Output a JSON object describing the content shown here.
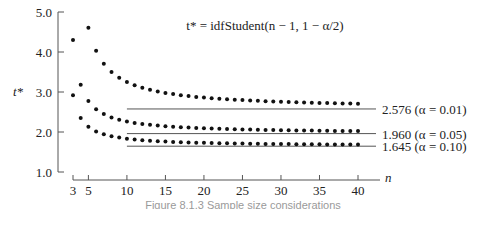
{
  "chart_data": {
    "type": "scatter",
    "title": "",
    "formula": "t* = idfStudent(n − 1, 1 − α/2)",
    "xlabel": "n",
    "ylabel": "t*",
    "xlim": [
      3,
      40
    ],
    "ylim": [
      1.0,
      5.0
    ],
    "x_ticks": [
      3,
      5,
      10,
      15,
      20,
      25,
      30,
      35,
      40
    ],
    "y_ticks": [
      "1.0",
      "2.0",
      "3.0",
      "4.0",
      "5.0"
    ],
    "grid": false,
    "series": [
      {
        "name": "α = 0.01",
        "x": [
          3,
          4,
          5,
          6,
          7,
          8,
          9,
          10,
          11,
          12,
          13,
          14,
          15,
          16,
          17,
          18,
          19,
          20,
          21,
          22,
          23,
          24,
          25,
          26,
          27,
          28,
          29,
          30,
          31,
          32,
          33,
          34,
          35,
          36,
          37,
          38,
          39,
          40
        ],
        "values": [
          9.925,
          5.841,
          4.604,
          4.032,
          3.707,
          3.499,
          3.355,
          3.25,
          3.169,
          3.106,
          3.055,
          3.012,
          2.977,
          2.947,
          2.921,
          2.898,
          2.878,
          2.861,
          2.845,
          2.831,
          2.819,
          2.807,
          2.797,
          2.787,
          2.779,
          2.771,
          2.763,
          2.756,
          2.75,
          2.744,
          2.738,
          2.733,
          2.728,
          2.724,
          2.719,
          2.715,
          2.712,
          2.708
        ],
        "asymptote": 2.576,
        "asymptote_label": "2.576 (α = 0.01)"
      },
      {
        "name": "α = 0.05",
        "x": [
          3,
          4,
          5,
          6,
          7,
          8,
          9,
          10,
          11,
          12,
          13,
          14,
          15,
          16,
          17,
          18,
          19,
          20,
          21,
          22,
          23,
          24,
          25,
          26,
          27,
          28,
          29,
          30,
          31,
          32,
          33,
          34,
          35,
          36,
          37,
          38,
          39,
          40
        ],
        "values": [
          4.303,
          3.182,
          2.776,
          2.571,
          2.447,
          2.365,
          2.306,
          2.262,
          2.228,
          2.201,
          2.179,
          2.16,
          2.145,
          2.131,
          2.12,
          2.11,
          2.101,
          2.093,
          2.086,
          2.08,
          2.074,
          2.069,
          2.064,
          2.06,
          2.056,
          2.052,
          2.048,
          2.045,
          2.042,
          2.04,
          2.037,
          2.035,
          2.032,
          2.03,
          2.028,
          2.026,
          2.024,
          2.023
        ],
        "asymptote": 1.96,
        "asymptote_label": "1.960 (α = 0.05)"
      },
      {
        "name": "α = 0.10",
        "x": [
          3,
          4,
          5,
          6,
          7,
          8,
          9,
          10,
          11,
          12,
          13,
          14,
          15,
          16,
          17,
          18,
          19,
          20,
          21,
          22,
          23,
          24,
          25,
          26,
          27,
          28,
          29,
          30,
          31,
          32,
          33,
          34,
          35,
          36,
          37,
          38,
          39,
          40
        ],
        "values": [
          2.92,
          2.353,
          2.132,
          2.015,
          1.943,
          1.895,
          1.86,
          1.833,
          1.812,
          1.796,
          1.782,
          1.771,
          1.761,
          1.753,
          1.746,
          1.74,
          1.734,
          1.729,
          1.725,
          1.721,
          1.717,
          1.714,
          1.711,
          1.708,
          1.706,
          1.703,
          1.701,
          1.699,
          1.697,
          1.696,
          1.694,
          1.692,
          1.691,
          1.69,
          1.688,
          1.687,
          1.686,
          1.685
        ],
        "asymptote": 1.645,
        "asymptote_label": "1.645 (α = 0.10)"
      }
    ],
    "legend_position": "right-side annotations"
  },
  "caption": "Figure 8.1.3  Sample size considerations"
}
